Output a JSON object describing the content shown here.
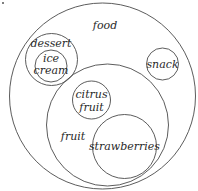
{
  "diagram": {
    "type": "euler-diagram",
    "stroke_color": "#4a4a4a",
    "text_color": "#2a2a2a",
    "sets": [
      {
        "id": "food",
        "label": "food",
        "parent": null,
        "circle": {
          "cx": 102.5,
          "cy": 96,
          "r": 93
        },
        "label_lines": [
          {
            "text": "food",
            "x": 105,
            "y": 29
          }
        ]
      },
      {
        "id": "dessert",
        "label": "dessert",
        "parent": "food",
        "circle": {
          "cx": 51.5,
          "cy": 59.5,
          "r": 26
        },
        "label_lines": [
          {
            "text": "dessert",
            "x": 51,
            "y": 47
          }
        ]
      },
      {
        "id": "ice-cream",
        "label": "ice cream",
        "parent": "dessert",
        "circle": {
          "cx": 51,
          "cy": 66,
          "r": 16
        },
        "label_lines": [
          {
            "text": "ice",
            "x": 51,
            "y": 62
          },
          {
            "text": "cream",
            "x": 51,
            "y": 74
          }
        ]
      },
      {
        "id": "snack",
        "label": "snack",
        "parent": "food",
        "circle": {
          "cx": 162.5,
          "cy": 64,
          "r": 16
        },
        "label_lines": [
          {
            "text": "snack",
            "x": 162.5,
            "y": 68
          }
        ]
      },
      {
        "id": "fruit",
        "label": "fruit",
        "parent": "food",
        "circle": {
          "cx": 107.5,
          "cy": 125,
          "r": 61
        },
        "label_lines": [
          {
            "text": "fruit",
            "x": 73,
            "y": 140
          }
        ]
      },
      {
        "id": "citrus-fruit",
        "label": "citrus fruit",
        "parent": "fruit",
        "circle": {
          "cx": 91.5,
          "cy": 100,
          "r": 19
        },
        "label_lines": [
          {
            "text": "citrus",
            "x": 91.5,
            "y": 98
          },
          {
            "text": "fruit",
            "x": 91.5,
            "y": 111
          }
        ]
      },
      {
        "id": "strawberries",
        "label": "strawberries",
        "parent": "fruit",
        "circle": {
          "cx": 124.5,
          "cy": 146.5,
          "r": 32
        },
        "label_lines": [
          {
            "text": "strawberries",
            "x": 124.5,
            "y": 150
          }
        ]
      }
    ]
  }
}
